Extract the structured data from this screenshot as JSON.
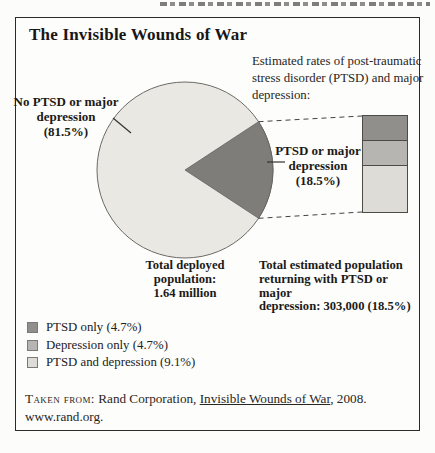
{
  "figure": {
    "title": "The Invisible Wounds of War",
    "intro": "Estimated rates of post-traumatic stress disorder (PTSD) and major depression:"
  },
  "callouts": {
    "no_ptsd": "No PTSD or major\ndepression\n(81.5%)",
    "ptsd": "PTSD or major\ndepression\n(18.5%)",
    "total_deployed": "Total deployed\npopulation:\n1.64 million",
    "total_returning": "Total estimated population\nreturning with PTSD or major\ndepression: 303,000 (18.5%)"
  },
  "chart_data": {
    "type": "pie",
    "title": "The Invisible Wounds of War",
    "slices": [
      {
        "label": "No PTSD or major depression",
        "value": 81.5,
        "color": "#e9e8e3"
      },
      {
        "label": "PTSD or major depression",
        "value": 18.5,
        "color": "#7e7d7a"
      }
    ],
    "breakdown_bar": {
      "represents_pct": 18.5,
      "segments": [
        {
          "label": "PTSD only",
          "value": 4.7,
          "color": "#908f8c"
        },
        {
          "label": "Depression only",
          "value": 4.7,
          "color": "#b6b5b1"
        },
        {
          "label": "PTSD and depression",
          "value": 9.1,
          "color": "#dedcd7"
        }
      ]
    },
    "annotations": {
      "total_deployed_population": "1.64 million",
      "total_returning_population": "303,000 (18.5%)"
    },
    "legend_position": "bottom-left",
    "grid": false
  },
  "legend": {
    "items": [
      {
        "label": "PTSD only (4.7%)",
        "color": "#908f8c"
      },
      {
        "label": "Depression only (4.7%)",
        "color": "#b6b5b1"
      },
      {
        "label": "PTSD and depression (9.1%)",
        "color": "#dedcd7"
      }
    ]
  },
  "source": {
    "prefix": "Taken from:",
    "body": " Rand Corporation, ",
    "work": "Invisible Wounds of War",
    "suffix": ", 2008.",
    "url": "www.rand.org."
  }
}
